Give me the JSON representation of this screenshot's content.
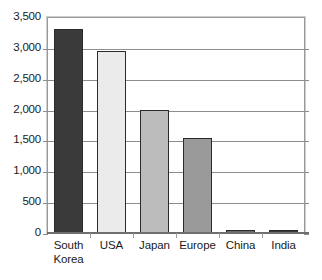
{
  "chart_data": {
    "type": "bar",
    "title": "",
    "xlabel": "",
    "ylabel": "",
    "categories": [
      "South Korea",
      "USA",
      "Japan",
      "Europe",
      "China",
      "India"
    ],
    "values": [
      3300,
      2950,
      1990,
      1540,
      50,
      30
    ],
    "ylim": [
      0,
      3500
    ],
    "yticks": [
      0,
      500,
      1000,
      1500,
      2000,
      2500,
      3000,
      3500
    ],
    "ytick_labels": [
      "0",
      "500",
      "1,000",
      "1,500",
      "2,000",
      "2,500",
      "3,000",
      "3,500"
    ],
    "grid": true,
    "legend": "none",
    "bar_colors": [
      "#3a3a3a",
      "#ebebeb",
      "#bcbcbc",
      "#9a9a9a",
      "#6a6a6a",
      "#3a3a3a"
    ],
    "bar_edge_color": "#2b2b2b",
    "gridline_color": "#8d8d8d",
    "frame_color": "#9a9a9a",
    "background_color": "#ffffff",
    "text_color": "#1a1a1a",
    "series": [
      {
        "name": "",
        "points": [
          {
            "category": "South Korea",
            "label": "South\nKorea",
            "value": 3300,
            "color": "#3a3a3a"
          },
          {
            "category": "USA",
            "label": "USA",
            "value": 2950,
            "color": "#ebebeb"
          },
          {
            "category": "Japan",
            "label": "Japan",
            "value": 1990,
            "color": "#bcbcbc"
          },
          {
            "category": "Europe",
            "label": "Europe",
            "value": 1540,
            "color": "#9a9a9a"
          },
          {
            "category": "China",
            "label": "China",
            "value": 50,
            "color": "#6a6a6a"
          },
          {
            "category": "India",
            "label": "India",
            "value": 30,
            "color": "#3a3a3a"
          }
        ]
      }
    ]
  }
}
